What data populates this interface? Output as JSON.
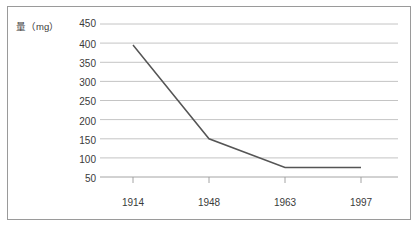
{
  "chart_data": {
    "type": "line",
    "title": "",
    "xlabel": "",
    "ylabel": "量（mg）",
    "x": [
      1914,
      1948,
      1963,
      1997
    ],
    "categories": [
      "1914",
      "1948",
      "1963",
      "1997"
    ],
    "values": [
      395,
      150,
      75,
      75
    ],
    "series": [
      {
        "name": "量（mg）",
        "values": [
          395,
          150,
          75,
          75
        ]
      }
    ],
    "ylim": [
      50,
      450
    ],
    "ytick_labels": [
      "450",
      "400",
      "350",
      "300",
      "250",
      "200",
      "150",
      "100",
      "50"
    ],
    "ytick_values": [
      450,
      400,
      350,
      300,
      250,
      200,
      150,
      100,
      50
    ],
    "xtick_labels": [
      "1914",
      "1948",
      "1963",
      "1997"
    ],
    "grid": true,
    "legend": false,
    "legend_position": "none",
    "line_color": "#555555",
    "grid_color": "#b5b5b5",
    "axis_color": "#9a9a9a",
    "frame_color": "#9a9a9a",
    "background_color": "#ffffff",
    "text_color": "#3a3a3a"
  }
}
